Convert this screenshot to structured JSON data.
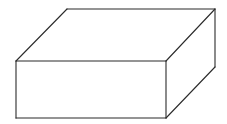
{
  "diagram": {
    "type": "rectangular-prism-line-drawing",
    "colors": {
      "background": "#ffffff",
      "stroke": "#2b2b2b"
    },
    "vertices": {
      "front_top_left": [
        16,
        61
      ],
      "front_top_right": [
        166,
        61
      ],
      "front_bottom_right": [
        166,
        118
      ],
      "front_bottom_left": [
        16,
        118
      ],
      "back_top_left": [
        67,
        9
      ],
      "back_top_right": [
        215,
        9
      ],
      "back_bottom_right": [
        215,
        67
      ]
    },
    "faces": [
      "front",
      "top",
      "right-side"
    ],
    "hidden_edges_shown": false
  }
}
